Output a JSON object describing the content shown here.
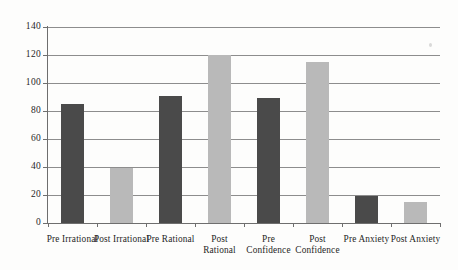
{
  "chart_data": {
    "type": "bar",
    "title": "",
    "subtitle": "",
    "xlabel": "",
    "ylabel": "",
    "ylim": [
      0,
      140
    ],
    "yticks": [
      0,
      20,
      40,
      60,
      80,
      100,
      120,
      140
    ],
    "grid": true,
    "legend": "none",
    "categories": [
      "Pre Irrational",
      "Post Irrational",
      "Pre Rational",
      "Post Rational",
      "Pre Confidence",
      "Post Confidence",
      "Pre Anxiety",
      "Post Anxiety"
    ],
    "category_lines": [
      [
        "Pre Irrational"
      ],
      [
        "Post Irrational"
      ],
      [
        "Pre Rational"
      ],
      [
        "Post",
        "Rational"
      ],
      [
        "Pre",
        "Confidence"
      ],
      [
        "Post",
        "Confidence"
      ],
      [
        "Pre Anxiety"
      ],
      [
        "Post Anxiety"
      ]
    ],
    "values": [
      85,
      39,
      91,
      120,
      89,
      115,
      19,
      15
    ],
    "bar_colors": [
      "#4a4a4a",
      "#b9b9b9",
      "#4a4a4a",
      "#b9b9b9",
      "#4a4a4a",
      "#b9b9b9",
      "#4a4a4a",
      "#b9b9b9"
    ],
    "series": [
      {
        "name": "Pre",
        "color": "#4a4a4a",
        "points": [
          {
            "category": "Pre Irrational",
            "value": 85
          },
          {
            "category": "Pre Rational",
            "value": 91
          },
          {
            "category": "Pre Confidence",
            "value": 89
          },
          {
            "category": "Pre Anxiety",
            "value": 19
          }
        ]
      },
      {
        "name": "Post",
        "color": "#b9b9b9",
        "points": [
          {
            "category": "Post Irrational",
            "value": 39
          },
          {
            "category": "Post Rational",
            "value": 120
          },
          {
            "category": "Post Confidence",
            "value": 115
          },
          {
            "category": "Post Anxiety",
            "value": 15
          }
        ]
      }
    ]
  },
  "axis": {
    "ytick_labels": [
      "0",
      "20",
      "40",
      "60",
      "80",
      "100",
      "120",
      "140"
    ]
  },
  "colors": {
    "background": "#fdfdfc",
    "axis": "#6e6e6e",
    "gridline": "#8d8d8d",
    "dark_bar": "#4a4a4a",
    "light_bar": "#b9b9b9",
    "text": "#1f1f1f"
  }
}
